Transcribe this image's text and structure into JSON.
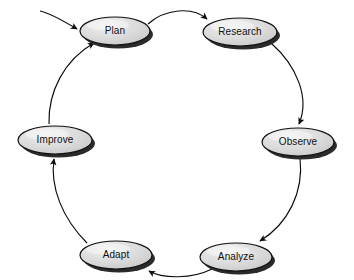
{
  "diagram": {
    "type": "cycle-flow-diagram",
    "background_color": "#ffffff",
    "node_fill_color": "#d9d9d9",
    "node_highlight_color": "#f2f2f2",
    "node_stroke_color": "#111111",
    "node_shadow_color": "#2b2b2b",
    "edge_color": "#0d0d0d",
    "label_color": "#101010",
    "nodes": [
      {
        "id": "plan",
        "label": "Plan",
        "cx": 115,
        "cy": 31,
        "rx": 35,
        "ry": 14
      },
      {
        "id": "research",
        "label": "Research",
        "cx": 240,
        "cy": 32,
        "rx": 37,
        "ry": 14
      },
      {
        "id": "observe",
        "label": "Observe",
        "cx": 298,
        "cy": 142,
        "rx": 36,
        "ry": 14
      },
      {
        "id": "analyze",
        "label": "Analyze",
        "cx": 236,
        "cy": 257,
        "rx": 36,
        "ry": 14
      },
      {
        "id": "adapt",
        "label": "Adapt",
        "cx": 116,
        "cy": 255,
        "rx": 36,
        "ry": 14
      },
      {
        "id": "improve",
        "label": "Improve",
        "cx": 55,
        "cy": 140,
        "rx": 37,
        "ry": 14
      }
    ],
    "edges": [
      {
        "id": "entry-to-plan",
        "from": "start",
        "to": "plan",
        "label": ""
      },
      {
        "id": "plan-to-research",
        "from": "plan",
        "to": "research",
        "label": ""
      },
      {
        "id": "research-to-observe",
        "from": "research",
        "to": "observe",
        "label": ""
      },
      {
        "id": "observe-to-analyze",
        "from": "observe",
        "to": "analyze",
        "label": ""
      },
      {
        "id": "analyze-to-adapt",
        "from": "analyze",
        "to": "adapt",
        "label": ""
      },
      {
        "id": "adapt-to-improve",
        "from": "adapt",
        "to": "improve",
        "label": ""
      },
      {
        "id": "improve-to-plan",
        "from": "improve",
        "to": "plan",
        "label": ""
      }
    ]
  }
}
